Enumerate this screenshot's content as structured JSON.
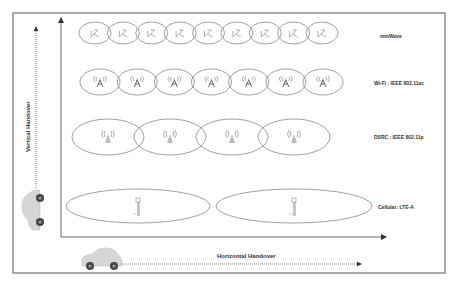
{
  "diagram": {
    "title": "",
    "axes": {
      "vertical_label": "Vertical Handover",
      "horizontal_label": "Horizontal Handover"
    },
    "layers": [
      {
        "id": "mmwave",
        "label": "mmWave",
        "icon": "mmwave-antenna-icon",
        "cell_count": 9
      },
      {
        "id": "wifi",
        "label": "Wi-Fi : IEEE 802.11ac",
        "icon": "wifi-access-point-icon",
        "cell_count": 7
      },
      {
        "id": "dsrc",
        "label": "DSRC : IEEE 802.11p",
        "icon": "dsrc-radio-tower-icon",
        "cell_count": 4
      },
      {
        "id": "cellular",
        "label": "Cellular: LTE-A",
        "icon": "cell-tower-icon",
        "cell_count": 2
      }
    ],
    "vehicles": [
      {
        "id": "vertical-car",
        "icon": "car-icon",
        "orientation": "vertical"
      },
      {
        "id": "horizontal-car",
        "icon": "car-icon",
        "orientation": "horizontal"
      }
    ],
    "colors": {
      "frame": "#555555",
      "ellipse": "#777777",
      "icon": "#999999",
      "text": "#333333",
      "car_body": "#d6d6d6",
      "wheel": "#444444"
    }
  }
}
